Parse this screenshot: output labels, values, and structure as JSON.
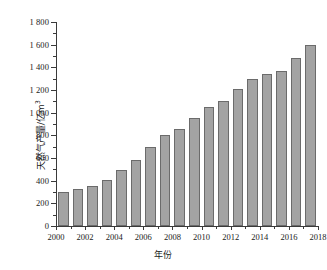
{
  "chart_data": {
    "type": "bar",
    "title": "",
    "xlabel": "年份",
    "ylabel": "天然气产量/亿m³",
    "ylabel_base": "天然气产量/亿m",
    "ylabel_sup": "3",
    "xlim": [
      2000,
      2018
    ],
    "ylim": [
      0,
      1800
    ],
    "grid": false,
    "legend": null,
    "y_tick_step": 200,
    "y_minor_step": 100,
    "x_tick_step": 2,
    "x_minor_step": 1,
    "bar_color": "#a3a3a3",
    "bar_edge_color": "#6b6b6b",
    "axis_color": "#3a3a3a",
    "ytick_labels": [
      "0",
      "200",
      "400",
      "600",
      "800",
      "1 000",
      "1 200",
      "1 400",
      "1 600",
      "1 800"
    ],
    "ytick_values": [
      0,
      200,
      400,
      600,
      800,
      1000,
      1200,
      1400,
      1600,
      1800
    ],
    "xtick_labels": [
      "2000",
      "2002",
      "2004",
      "2006",
      "2008",
      "2010",
      "2012",
      "2014",
      "2016",
      "2018"
    ],
    "xtick_values": [
      2000,
      2002,
      2004,
      2006,
      2008,
      2010,
      2012,
      2014,
      2016,
      2018
    ],
    "categories": [
      2001,
      2002,
      2003,
      2004,
      2005,
      2006,
      2007,
      2008,
      2009,
      2010,
      2011,
      2012,
      2013,
      2014,
      2015,
      2016,
      2017,
      2018
    ],
    "values": [
      300,
      325,
      350,
      410,
      495,
      585,
      695,
      800,
      855,
      955,
      1050,
      1100,
      1205,
      1300,
      1345,
      1370,
      1480,
      1600
    ]
  }
}
